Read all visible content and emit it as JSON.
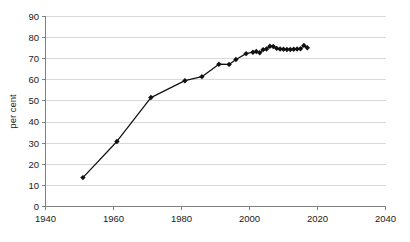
{
  "chart_data": {
    "type": "line",
    "title": "",
    "xlabel": "",
    "ylabel": "per cent",
    "xlim": [
      1940,
      2040
    ],
    "ylim": [
      0,
      90
    ],
    "xticks": [
      1940,
      1960,
      1980,
      2000,
      2020,
      2040
    ],
    "yticks": [
      0,
      10,
      20,
      30,
      40,
      50,
      60,
      70,
      80,
      90
    ],
    "grid": "horizontal",
    "legend": "none",
    "marker": "diamond",
    "line_color": "#111111",
    "grid_color": "#d9d9d9",
    "axis_color": "#808080",
    "series": [
      {
        "name": "per cent",
        "x": [
          1951,
          1961,
          1971,
          1981,
          1986,
          1991,
          1994,
          1996,
          1999,
          2001,
          2002,
          2003,
          2004,
          2005,
          2006,
          2007,
          2008,
          2009,
          2010,
          2011,
          2012,
          2013,
          2014,
          2015,
          2016,
          2017
        ],
        "y": [
          13.7,
          30.8,
          51.6,
          59.6,
          61.5,
          67.4,
          67.3,
          69.6,
          72.4,
          73.1,
          73.4,
          72.8,
          74.3,
          74.6,
          75.9,
          75.8,
          74.9,
          74.6,
          74.5,
          74.4,
          74.4,
          74.5,
          74.6,
          74.7,
          76.3,
          75.2
        ]
      }
    ]
  },
  "axis": {
    "y_title": "per cent",
    "x_tick_labels": [
      "1940",
      "1960",
      "1980",
      "2000",
      "2020",
      "2040"
    ],
    "y_tick_labels": [
      "0",
      "10",
      "20",
      "30",
      "40",
      "50",
      "60",
      "70",
      "80",
      "90"
    ]
  }
}
